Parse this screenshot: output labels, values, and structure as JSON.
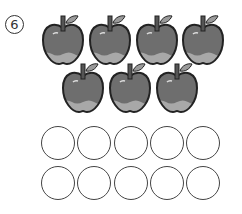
{
  "problem": {
    "number_label": "⑥",
    "number_value": "6"
  },
  "apples": {
    "count": 7,
    "icon": "apple-icon",
    "rows": [
      {
        "count": 4,
        "centers_x": [
          63,
          110,
          157,
          203
        ],
        "top": 14
      },
      {
        "count": 3,
        "centers_x": [
          83,
          130,
          177
        ],
        "top": 62
      }
    ],
    "colors": {
      "body": "#6e6e6e",
      "outline": "#222222",
      "bottom": "#a8a8a8",
      "leaf": "#9a9a9a",
      "stem": "#555555"
    }
  },
  "answer_circles": {
    "rows": 2,
    "columns": 5,
    "total": 10,
    "centers_x": [
      58,
      94,
      131,
      167,
      203
    ],
    "centers_y": [
      143,
      183
    ]
  }
}
